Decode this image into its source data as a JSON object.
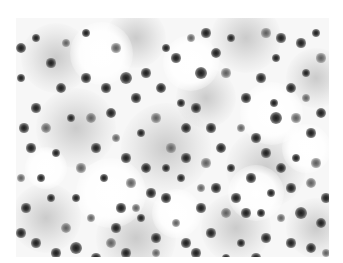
{
  "image": {
    "description": "Grayscale micrograph of densely scattered dark-stained round cells on a pale background",
    "frame": {
      "x": 16,
      "y": 18,
      "width": 313,
      "height": 239
    },
    "colors": {
      "background": "#ffffff",
      "cell_dark": "#1a1a1a",
      "cell_mid": "#777777",
      "field": "#f7f7f7"
    }
  },
  "haze": [
    [
      40,
      40,
      70
    ],
    [
      120,
      20,
      60
    ],
    [
      230,
      20,
      70
    ],
    [
      300,
      60,
      60
    ],
    [
      60,
      110,
      80
    ],
    [
      150,
      130,
      90
    ],
    [
      250,
      150,
      80
    ],
    [
      30,
      200,
      70
    ],
    [
      120,
      220,
      80
    ],
    [
      220,
      210,
      70
    ],
    [
      300,
      210,
      60
    ],
    [
      190,
      80,
      60
    ]
  ],
  "clear": [
    [
      85,
      35,
      45
    ],
    [
      175,
      45,
      40
    ],
    [
      255,
      95,
      45
    ],
    [
      95,
      175,
      50
    ],
    [
      240,
      175,
      40
    ],
    [
      30,
      150,
      30
    ],
    [
      290,
      130,
      35
    ],
    [
      160,
      195,
      35
    ]
  ],
  "cells": [
    [
      5,
      30,
      8
    ],
    [
      20,
      20,
      6
    ],
    [
      35,
      45,
      7
    ],
    [
      50,
      25,
      6
    ],
    [
      70,
      60,
      7
    ],
    [
      45,
      70,
      8
    ],
    [
      20,
      90,
      7
    ],
    [
      30,
      110,
      8
    ],
    [
      55,
      100,
      6
    ],
    [
      15,
      130,
      7
    ],
    [
      40,
      135,
      6
    ],
    [
      65,
      150,
      7
    ],
    [
      25,
      160,
      6
    ],
    [
      10,
      190,
      7
    ],
    [
      35,
      180,
      6
    ],
    [
      50,
      210,
      8
    ],
    [
      20,
      225,
      7
    ],
    [
      40,
      235,
      7
    ],
    [
      60,
      230,
      9
    ],
    [
      75,
      200,
      6
    ],
    [
      90,
      70,
      7
    ],
    [
      95,
      95,
      8
    ],
    [
      110,
      60,
      9
    ],
    [
      100,
      120,
      6
    ],
    [
      120,
      80,
      7
    ],
    [
      130,
      55,
      7
    ],
    [
      145,
      70,
      8
    ],
    [
      140,
      100,
      7
    ],
    [
      125,
      115,
      6
    ],
    [
      110,
      140,
      7
    ],
    [
      130,
      150,
      8
    ],
    [
      115,
      165,
      7
    ],
    [
      105,
      190,
      7
    ],
    [
      125,
      200,
      6
    ],
    [
      140,
      220,
      7
    ],
    [
      95,
      225,
      8
    ],
    [
      110,
      235,
      7
    ],
    [
      150,
      180,
      7
    ],
    [
      165,
      160,
      6
    ],
    [
      155,
      130,
      7
    ],
    [
      170,
      110,
      8
    ],
    [
      180,
      90,
      7
    ],
    [
      160,
      40,
      7
    ],
    [
      175,
      20,
      6
    ],
    [
      190,
      15,
      7
    ],
    [
      200,
      35,
      8
    ],
    [
      185,
      55,
      9
    ],
    [
      210,
      55,
      7
    ],
    [
      215,
      20,
      6
    ],
    [
      195,
      110,
      7
    ],
    [
      205,
      130,
      8
    ],
    [
      190,
      145,
      7
    ],
    [
      215,
      150,
      6
    ],
    [
      200,
      170,
      7
    ],
    [
      185,
      190,
      7
    ],
    [
      210,
      195,
      8
    ],
    [
      195,
      215,
      7
    ],
    [
      225,
      225,
      6
    ],
    [
      170,
      225,
      7
    ],
    [
      160,
      205,
      6
    ],
    [
      230,
      80,
      7
    ],
    [
      245,
      60,
      7
    ],
    [
      260,
      40,
      6
    ],
    [
      250,
      15,
      7
    ],
    [
      265,
      20,
      7
    ],
    [
      285,
      25,
      7
    ],
    [
      300,
      15,
      6
    ],
    [
      305,
      40,
      7
    ],
    [
      290,
      55,
      6
    ],
    [
      275,
      70,
      8
    ],
    [
      260,
      100,
      9
    ],
    [
      280,
      100,
      7
    ],
    [
      295,
      115,
      7
    ],
    [
      305,
      95,
      8
    ],
    [
      240,
      120,
      7
    ],
    [
      225,
      110,
      6
    ],
    [
      250,
      135,
      7
    ],
    [
      265,
      150,
      8
    ],
    [
      280,
      140,
      6
    ],
    [
      300,
      145,
      7
    ],
    [
      235,
      160,
      7
    ],
    [
      255,
      175,
      6
    ],
    [
      275,
      170,
      7
    ],
    [
      295,
      165,
      8
    ],
    [
      310,
      180,
      7
    ],
    [
      285,
      195,
      9
    ],
    [
      305,
      205,
      8
    ],
    [
      265,
      200,
      6
    ],
    [
      250,
      220,
      7
    ],
    [
      275,
      225,
      7
    ],
    [
      295,
      230,
      8
    ],
    [
      310,
      235,
      6
    ],
    [
      240,
      240,
      7
    ],
    [
      210,
      240,
      6
    ],
    [
      180,
      235,
      7
    ],
    [
      140,
      235,
      6
    ],
    [
      80,
      240,
      7
    ],
    [
      60,
      180,
      6
    ],
    [
      80,
      130,
      7
    ],
    [
      75,
      100,
      8
    ],
    [
      150,
      150,
      6
    ],
    [
      170,
      140,
      7
    ],
    [
      135,
      175,
      7
    ],
    [
      185,
      170,
      6
    ],
    [
      220,
      180,
      7
    ],
    [
      165,
      85,
      6
    ],
    [
      150,
      30,
      6
    ],
    [
      100,
      30,
      7
    ],
    [
      70,
      15,
      6
    ],
    [
      5,
      60,
      6
    ],
    [
      8,
      110,
      7
    ],
    [
      5,
      160,
      6
    ],
    [
      5,
      215,
      7
    ],
    [
      88,
      160,
      6
    ],
    [
      100,
      210,
      7
    ],
    [
      120,
      190,
      6
    ],
    [
      230,
      195,
      7
    ],
    [
      245,
      195,
      6
    ],
    [
      258,
      85,
      6
    ],
    [
      290,
      80,
      6
    ]
  ]
}
